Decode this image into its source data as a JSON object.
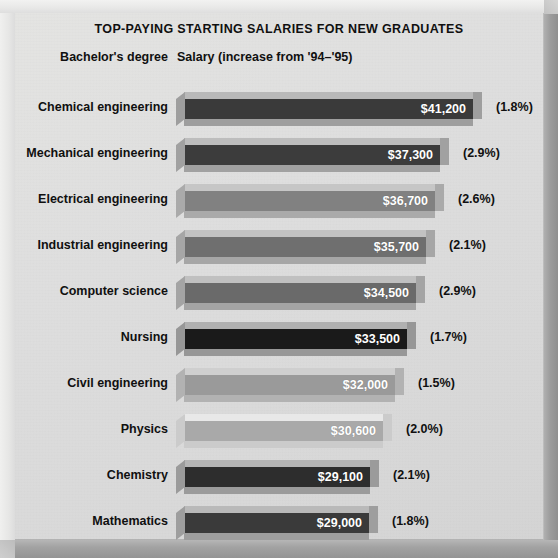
{
  "chart_data": {
    "type": "bar",
    "orientation": "horizontal",
    "title": "TOP-PAYING STARTING SALARIES FOR NEW GRADUATES",
    "column_headers": {
      "category": "Bachelor's degree",
      "value": "Salary (increase from '94–'95)"
    },
    "xlabel": "",
    "ylabel": "",
    "grid": false,
    "legend": "none",
    "xlim": [
      0,
      41200
    ],
    "categories": [
      "Chemical engineering",
      "Mechanical engineering",
      "Electrical engineering",
      "Industrial engineering",
      "Computer science",
      "Nursing",
      "Civil engineering",
      "Physics",
      "Chemistry",
      "Mathematics"
    ],
    "values": [
      41200,
      37300,
      36700,
      35700,
      34500,
      33500,
      32000,
      30600,
      29100,
      29000
    ],
    "value_labels": [
      "$41,200",
      "$37,300",
      "$36,700",
      "$35,700",
      "$34,500",
      "$33,500",
      "$32,000",
      "$30,600",
      "$29,100",
      "$29,000"
    ],
    "increase_pct": [
      1.8,
      2.9,
      2.6,
      2.1,
      2.9,
      1.7,
      1.5,
      2.0,
      2.1,
      1.8
    ],
    "increase_labels": [
      "(1.8%)",
      "(2.9%)",
      "(2.6%)",
      "(2.1%)",
      "(2.9%)",
      "(1.7%)",
      "(1.5%)",
      "(2.0%)",
      "(2.1%)",
      "(1.8%)"
    ],
    "bar_colors": [
      "#3a3a3a",
      "#3c3c3c",
      "#818181",
      "#6f6f6f",
      "#6a6a6a",
      "#1a1a1a",
      "#9a9a9a",
      "#a9a9a9",
      "#2d2d2d",
      "#3a3a3a"
    ],
    "bar_top_colors": [
      "#b9b9b9",
      "#bdbdbd",
      "#c6c6c6",
      "#c2c2c2",
      "#c0c0c0",
      "#b0b0b0",
      "#cfcfcf",
      "#e8e8e8",
      "#b5b5b5",
      "#b9b9b9"
    ],
    "bar_bottom_colors": [
      "#9e9e9e",
      "#a1a1a1",
      "#aaaaaa",
      "#a6a6a6",
      "#a4a4a4",
      "#979797",
      "#b2b2b2",
      "#cbcbcb",
      "#9b9b9b",
      "#9e9e9e"
    ]
  },
  "theme": {
    "panel_bg": "#dedede",
    "text_color": "#101010",
    "value_text_color": "#ffffff"
  }
}
